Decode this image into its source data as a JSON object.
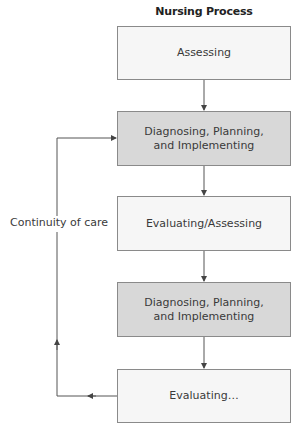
{
  "diagram": {
    "title": "Nursing Process",
    "steps": [
      {
        "label": "Assessing",
        "style": "light"
      },
      {
        "label_line1": "Diagnosing, Planning,",
        "label_line2": "and Implementing",
        "style": "shaded"
      },
      {
        "label": "Evaluating/Assessing",
        "style": "light"
      },
      {
        "label_line1": "Diagnosing, Planning,",
        "label_line2": "and Implementing",
        "style": "shaded"
      },
      {
        "label": "Evaluating…",
        "style": "light"
      }
    ],
    "feedback_loop": {
      "label": "Continuity of care",
      "from": "Evaluating…",
      "to": "Diagnosing, Planning, and Implementing"
    },
    "colors": {
      "box_light": "#f6f6f6",
      "box_shaded": "#d8d8d8",
      "border": "#8a8a8a",
      "line": "#555555"
    }
  }
}
